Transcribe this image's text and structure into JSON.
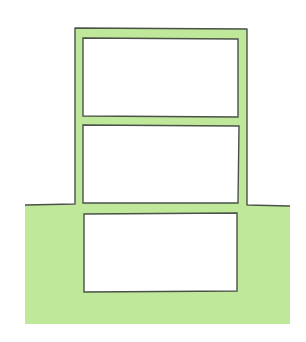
{
  "diagram": {
    "colors": {
      "fill": "#bfe89a",
      "outline": "#4a5248",
      "background": "#ffffff",
      "room": "#ffffff"
    },
    "elements": [
      {
        "name": "ground",
        "label": ""
      },
      {
        "name": "upper-floor-room",
        "label": ""
      },
      {
        "name": "middle-floor-room",
        "label": ""
      },
      {
        "name": "basement-room",
        "label": ""
      }
    ]
  }
}
